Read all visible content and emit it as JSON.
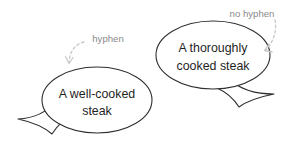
{
  "figure": {
    "background_color": "#ffffff",
    "width": 307,
    "height": 143,
    "outline_color": "#2e2e2e",
    "annotation_color": "#8a8a8a",
    "arrow_color": "#c8c8c8",
    "bubble_text_color": "#1f1f1f"
  },
  "bubbles": [
    {
      "id": "left",
      "line1": "A well-cooked",
      "line2": "steak",
      "tail_direction": "lower-left"
    },
    {
      "id": "right",
      "line1": "A thoroughly",
      "line2": "cooked steak",
      "tail_direction": "lower-right"
    }
  ],
  "annotations": [
    {
      "id": "hyphen",
      "label": "hyphen",
      "points_to": "left-bubble-hyphen"
    },
    {
      "id": "no-hyphen",
      "label": "no hyphen",
      "points_to": "right-bubble-word-gap"
    }
  ]
}
